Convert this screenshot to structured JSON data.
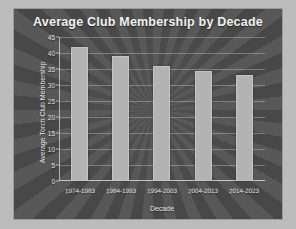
{
  "chart_data": {
    "type": "bar",
    "title": "Average Club Membership by Decade",
    "xlabel": "Decade",
    "ylabel": "Average Torch Club Membership",
    "categories": [
      "1974-1983",
      "1984-1993",
      "1994-2003",
      "2004-2013",
      "2014-2023"
    ],
    "values": [
      42,
      39,
      36,
      34.5,
      33
    ],
    "ylim": [
      0,
      45
    ],
    "yticks": [
      0,
      5,
      10,
      15,
      20,
      25,
      30,
      35,
      40,
      45
    ],
    "grid": true,
    "legend": "none",
    "colors": {
      "background": "#4f4f4f",
      "bar": "#b3b3b3",
      "text": "#f2f2f2",
      "gridline": "#c8c8c8",
      "frame": "#bcbcbc"
    }
  }
}
